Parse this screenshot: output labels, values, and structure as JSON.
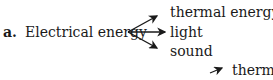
{
  "item": {
    "label": "a.",
    "source": "Electrical energy",
    "outputs": [
      "thermal energy",
      "light",
      "sound"
    ]
  },
  "next_item": {
    "partial_output": "therma"
  }
}
